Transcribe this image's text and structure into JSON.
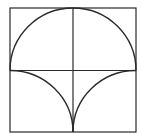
{
  "diagram": {
    "stroke_color": "#2a2a2a",
    "background": "#ffffff",
    "square": {
      "x": 10,
      "y": 8,
      "size": 126
    },
    "elements": [
      "outer-square",
      "vertical-midline",
      "horizontal-midline",
      "top-semicircle",
      "bottom-left-arc",
      "bottom-right-arc"
    ]
  }
}
